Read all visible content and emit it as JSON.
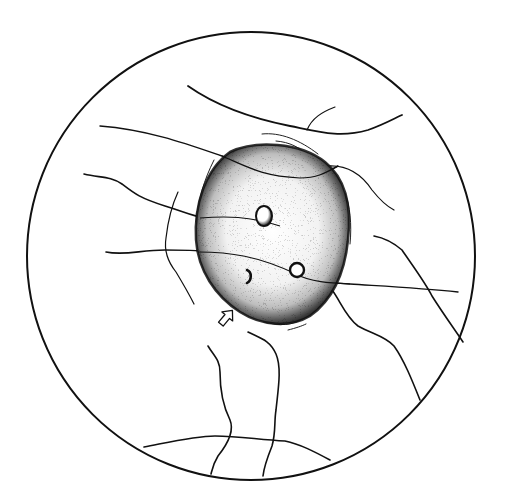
{
  "illustration": {
    "subject": "fundus-drawing-optic-disc",
    "background": "#ffffff",
    "ink": "#111111",
    "fundus_circle": {
      "cx": 251,
      "cy": 256,
      "r": 224
    },
    "optic_disc": {
      "cx": 272,
      "cy": 230,
      "rx": 78,
      "ry": 88
    },
    "pits": [
      {
        "cx": 264,
        "cy": 216,
        "rx": 8,
        "ry": 10
      },
      {
        "cx": 296,
        "cy": 270,
        "rx": 7,
        "ry": 7
      },
      {
        "cx": 248,
        "cy": 276,
        "rx": 3,
        "ry": 6
      }
    ],
    "arrow": {
      "x": 226,
      "y": 318,
      "direction": "up-right"
    }
  }
}
